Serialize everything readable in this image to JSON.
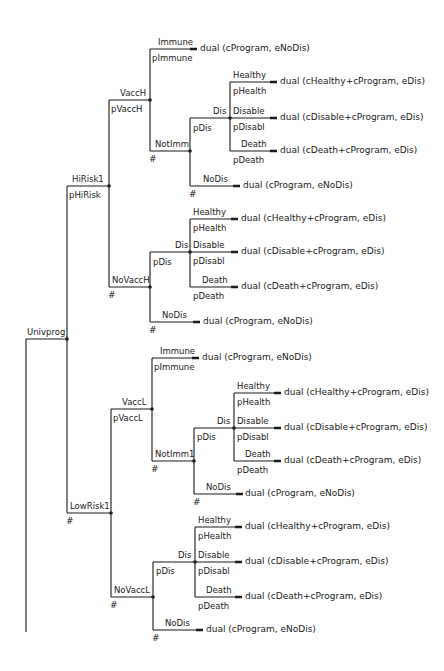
{
  "diagram": {
    "type": "decision-tree",
    "root": {
      "label": "Univprog"
    },
    "nodes": [
      {
        "id": "hirisk",
        "label": "HiRisk1",
        "prob": "pHiRisk"
      },
      {
        "id": "vacch",
        "label": "VaccH",
        "prob": "pVaccH"
      },
      {
        "id": "imm_h",
        "label": "Immune",
        "prob": "pImmune",
        "payoff": "dual (cProgram, eNoDis)"
      },
      {
        "id": "notimm_h",
        "label": "NotImm",
        "prob": "#"
      },
      {
        "id": "dis_h1",
        "label": "Dis",
        "prob": "pDis"
      },
      {
        "id": "healthy_h1",
        "label": "Healthy",
        "prob": "pHealth",
        "payoff": "dual (cHealthy+cProgram, eDis)"
      },
      {
        "id": "disable_h1",
        "label": "Disable",
        "prob": "pDisabl",
        "payoff": "dual (cDisable+cProgram, eDis)"
      },
      {
        "id": "death_h1",
        "label": "Death",
        "prob": "pDeath",
        "payoff": "dual (cDeath+cProgram, eDis)"
      },
      {
        "id": "nodis_h1",
        "label": "NoDis",
        "prob": "#",
        "payoff": "dual (cProgram, eNoDis)"
      },
      {
        "id": "novacch",
        "label": "NoVaccH",
        "prob": "#"
      },
      {
        "id": "dis_h2",
        "label": "Dis",
        "prob": "pDis"
      },
      {
        "id": "healthy_h2",
        "label": "Healthy",
        "prob": "pHealth",
        "payoff": "dual (cHealthy+cProgram, eDis)"
      },
      {
        "id": "disable_h2",
        "label": "Disable",
        "prob": "pDisabl",
        "payoff": "dual (cDisable+cProgram, eDis)"
      },
      {
        "id": "death_h2",
        "label": "Death",
        "prob": "pDeath",
        "payoff": "dual (cDeath+cProgram, eDis)"
      },
      {
        "id": "nodis_h2",
        "label": "NoDis",
        "prob": "#",
        "payoff": "dual (cProgram, eNoDis)"
      },
      {
        "id": "lowrisk",
        "label": "LowRisk1",
        "prob": "#"
      },
      {
        "id": "vaccl",
        "label": "VaccL",
        "prob": "pVaccL"
      },
      {
        "id": "imm_l",
        "label": "Immune",
        "prob": "pImmune",
        "payoff": "dual (cProgram, eNoDis)"
      },
      {
        "id": "notimm_l",
        "label": "NotImm1",
        "prob": "#"
      },
      {
        "id": "dis_l1",
        "label": "Dis",
        "prob": "pDis"
      },
      {
        "id": "healthy_l1",
        "label": "Healthy",
        "prob": "pHealth",
        "payoff": "dual (cHealthy+cProgram, eDis)"
      },
      {
        "id": "disable_l1",
        "label": "Disable",
        "prob": "pDisabl",
        "payoff": "dual (cDisable+cProgram, eDis)"
      },
      {
        "id": "death_l1",
        "label": "Death",
        "prob": "pDeath",
        "payoff": "dual (cDeath+cProgram, eDis)"
      },
      {
        "id": "nodis_l1",
        "label": "NoDis",
        "prob": "#",
        "payoff": "dual (cProgram, eNoDis)"
      },
      {
        "id": "novaccl",
        "label": "NoVaccL",
        "prob": "#"
      },
      {
        "id": "dis_l2",
        "label": "Dis",
        "prob": "pDis"
      },
      {
        "id": "healthy_l2",
        "label": "Healthy",
        "prob": "pHealth",
        "payoff": "dual (cHealthy+cProgram, eDis)"
      },
      {
        "id": "disable_l2",
        "label": "Disable",
        "prob": "pDisabl",
        "payoff": "dual (cDisable+cProgram, eDis)"
      },
      {
        "id": "death_l2",
        "label": "Death",
        "prob": "pDeath",
        "payoff": "dual (cDeath+cProgram, eDis)"
      },
      {
        "id": "nodis_l2",
        "label": "NoDis",
        "prob": "#",
        "payoff": "dual (cProgram, eNoDis)"
      }
    ]
  }
}
